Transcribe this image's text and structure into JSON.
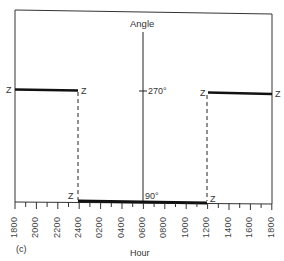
{
  "figure": {
    "panel_label": "(c)",
    "y_axis_title": "Angle",
    "x_axis_title": "Hour",
    "angle_labels": {
      "upper": "270°",
      "lower": "90°"
    },
    "markers": {
      "z": "Z"
    },
    "hour_ticks": [
      "1800",
      "2000",
      "2200",
      "2400",
      "0200",
      "0400",
      "0600",
      "0800",
      "1000",
      "1200",
      "1400",
      "1600",
      "1800"
    ],
    "colors": {
      "line": "#111111",
      "frame": "#333333",
      "background": "#ffffff"
    },
    "segments": [
      {
        "name": "left-high",
        "from": "1800",
        "to": "2400",
        "angle": "270°"
      },
      {
        "name": "middle-low",
        "from": "2400",
        "to": "1200",
        "angle": "90°"
      },
      {
        "name": "right-high",
        "from": "1200",
        "to": "1800",
        "angle": "270°"
      }
    ]
  }
}
